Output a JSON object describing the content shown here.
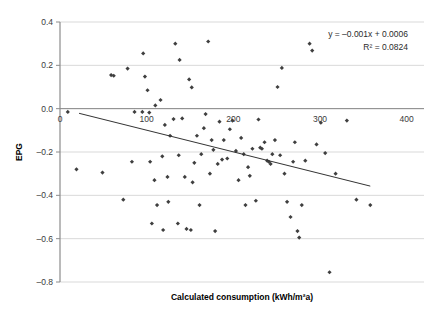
{
  "chart_data": {
    "type": "scatter",
    "title": "",
    "xlabel": "Calculated consumption (kWh/m²a)",
    "ylabel": "EPG",
    "xlim": [
      0,
      420
    ],
    "ylim": [
      -0.8,
      0.4
    ],
    "xticks": [
      0,
      100,
      200,
      300,
      400
    ],
    "xtick_labels": [
      "0",
      "100",
      "200",
      "300",
      "400"
    ],
    "yticks": [
      0.4,
      0.2,
      0.0,
      -0.2,
      -0.4,
      -0.6,
      -0.8
    ],
    "ytick_labels": [
      "0.4",
      "0.2",
      "0.0",
      "–0.2",
      "–0.4",
      "–0.6",
      "–0.8"
    ],
    "grid": "horizontal",
    "legend": "none",
    "marker_color": "#3f3f3f",
    "marker_shape": "diamond",
    "trendline": {
      "slope": -0.001,
      "intercept": 0.0006,
      "x_start": 22,
      "x_end": 358,
      "color": "#333333",
      "equation_label": "y = –0.001x + 0.0006",
      "r2_label": "R² = 0.0824"
    },
    "annotations": [
      "y = –0.001x + 0.0006",
      "R² = 0.0824"
    ],
    "points": [
      [
        9,
        -0.015
      ],
      [
        19,
        -0.28
      ],
      [
        49,
        -0.295
      ],
      [
        59,
        0.155
      ],
      [
        62,
        0.152
      ],
      [
        73,
        -0.42
      ],
      [
        78,
        0.185
      ],
      [
        83,
        -0.245
      ],
      [
        86,
        -0.015
      ],
      [
        95,
        -0.015
      ],
      [
        96,
        0.255
      ],
      [
        98,
        0.148
      ],
      [
        101,
        0.085
      ],
      [
        103,
        -0.018
      ],
      [
        104,
        -0.245
      ],
      [
        106,
        -0.53
      ],
      [
        109,
        -0.33
      ],
      [
        110,
        0.015
      ],
      [
        112,
        -0.445
      ],
      [
        116,
        0.04
      ],
      [
        118,
        -0.22
      ],
      [
        119,
        -0.56
      ],
      [
        121,
        -0.075
      ],
      [
        124,
        -0.315
      ],
      [
        125,
        -0.43
      ],
      [
        127,
        -0.125
      ],
      [
        131,
        -0.048
      ],
      [
        133,
        0.3
      ],
      [
        136,
        -0.53
      ],
      [
        137,
        -0.215
      ],
      [
        138,
        0.225
      ],
      [
        141,
        -0.045
      ],
      [
        144,
        -0.315
      ],
      [
        146,
        -0.555
      ],
      [
        149,
        0.135
      ],
      [
        151,
        -0.56
      ],
      [
        152,
        0.098
      ],
      [
        153,
        -0.34
      ],
      [
        155,
        -0.25
      ],
      [
        158,
        -0.125
      ],
      [
        161,
        -0.445
      ],
      [
        163,
        -0.21
      ],
      [
        166,
        -0.09
      ],
      [
        168,
        -0.025
      ],
      [
        171,
        0.31
      ],
      [
        173,
        -0.3
      ],
      [
        175,
        -0.145
      ],
      [
        177,
        -0.19
      ],
      [
        179,
        -0.565
      ],
      [
        182,
        -0.255
      ],
      [
        184,
        -0.06
      ],
      [
        187,
        -0.235
      ],
      [
        189,
        -0.145
      ],
      [
        193,
        -0.23
      ],
      [
        196,
        -0.095
      ],
      [
        199,
        -0.055
      ],
      [
        203,
        -0.195
      ],
      [
        206,
        -0.33
      ],
      [
        209,
        -0.135
      ],
      [
        212,
        -0.21
      ],
      [
        214,
        -0.445
      ],
      [
        217,
        -0.27
      ],
      [
        219,
        -0.31
      ],
      [
        222,
        -0.185
      ],
      [
        226,
        -0.425
      ],
      [
        229,
        -0.05
      ],
      [
        231,
        -0.18
      ],
      [
        233,
        -0.185
      ],
      [
        236,
        -0.155
      ],
      [
        239,
        -0.24
      ],
      [
        241,
        -0.245
      ],
      [
        243,
        -0.255
      ],
      [
        245,
        -0.21
      ],
      [
        248,
        -0.145
      ],
      [
        251,
        0.1
      ],
      [
        254,
        -0.215
      ],
      [
        256,
        0.188
      ],
      [
        259,
        -0.3
      ],
      [
        262,
        -0.43
      ],
      [
        266,
        -0.5
      ],
      [
        269,
        -0.245
      ],
      [
        271,
        -0.155
      ],
      [
        274,
        -0.565
      ],
      [
        276,
        -0.595
      ],
      [
        279,
        -0.445
      ],
      [
        283,
        -0.24
      ],
      [
        288,
        0.3
      ],
      [
        291,
        0.268
      ],
      [
        296,
        -0.165
      ],
      [
        301,
        -0.065
      ],
      [
        306,
        -0.205
      ],
      [
        311,
        -0.755
      ],
      [
        318,
        -0.3
      ],
      [
        331,
        -0.055
      ],
      [
        342,
        -0.42
      ],
      [
        358,
        -0.445
      ]
    ]
  },
  "caption": {
    "text": ""
  }
}
